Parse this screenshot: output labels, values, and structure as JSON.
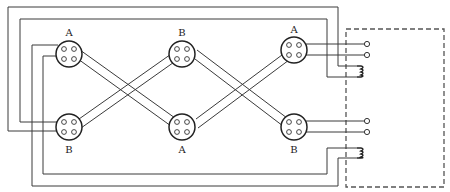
{
  "diagram": {
    "type": "wiring-diagram",
    "colors": {
      "line": "#3a3a3a",
      "enclosure_dash": "#555555",
      "background": "#ffffff"
    },
    "connectors": [
      {
        "id": "top-left",
        "label": "A",
        "row": "top",
        "col": 1,
        "pins": 4
      },
      {
        "id": "top-middle",
        "label": "B",
        "row": "top",
        "col": 2,
        "pins": 4
      },
      {
        "id": "top-right",
        "label": "A",
        "row": "top",
        "col": 3,
        "pins": 4
      },
      {
        "id": "bottom-left",
        "label": "B",
        "row": "bottom",
        "col": 1,
        "pins": 4
      },
      {
        "id": "bottom-middle",
        "label": "A",
        "row": "bottom",
        "col": 2,
        "pins": 4
      },
      {
        "id": "bottom-right",
        "label": "B",
        "row": "bottom",
        "col": 3,
        "pins": 4
      }
    ],
    "terminals": [
      {
        "id": "t1",
        "group": "top"
      },
      {
        "id": "t2",
        "group": "top"
      },
      {
        "id": "t3",
        "group": "bottom"
      },
      {
        "id": "t4",
        "group": "bottom"
      }
    ],
    "coils": [
      {
        "id": "coil-top",
        "group": "top"
      },
      {
        "id": "coil-bottom",
        "group": "bottom"
      }
    ],
    "enclosure": {
      "style": "dashed",
      "side": "right"
    }
  }
}
